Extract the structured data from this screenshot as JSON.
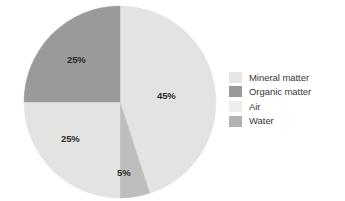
{
  "chart_data": {
    "type": "pie",
    "title": "",
    "subtitle": "",
    "xlabel": "",
    "ylabel": "",
    "grid": false,
    "legend_position": "right",
    "units": "percent",
    "start_angle_deg": 0,
    "direction": "clockwise",
    "categories": [
      "Mineral matter",
      "Organic matter",
      "Air",
      "Water"
    ],
    "values": [
      45,
      25,
      5,
      25
    ],
    "labels": [
      "45%",
      "25%",
      "5%",
      "25%"
    ],
    "colors": [
      "#e3e3e3",
      "#9a9a9a",
      "#bdbdbd",
      "#c9c9c9"
    ],
    "slices": [
      {
        "name": "Mineral matter",
        "value": 45,
        "label": "45%",
        "color": "#e3e3e3",
        "start_deg": 0,
        "end_deg": 162
      },
      {
        "name": "Air",
        "value": 5,
        "label": "5%",
        "color": "#bdbdbd",
        "start_deg": 162,
        "end_deg": 180
      },
      {
        "name": "Water",
        "value": 25,
        "label": "25%",
        "color": "#e3e3e3",
        "start_deg": 180,
        "end_deg": 270
      },
      {
        "name": "Organic matter",
        "value": 25,
        "label": "25%",
        "color": "#9a9a9a",
        "start_deg": 270,
        "end_deg": 360
      }
    ]
  },
  "pie": {
    "center_x": 120,
    "center_y": 102,
    "radius": 96,
    "labels": {
      "mineral": "45%",
      "organic": "25%",
      "water": "25%",
      "air": "5%"
    }
  },
  "legend": {
    "items": [
      {
        "label": "Mineral matter",
        "color": "#e6e6e6",
        "swatch_name": "legend-swatch-mineral-matter"
      },
      {
        "label": "Organic matter",
        "color": "#9a9a9a",
        "swatch_name": "legend-swatch-organic-matter"
      },
      {
        "label": "Air",
        "color": "#eeeeee",
        "swatch_name": "legend-swatch-air"
      },
      {
        "label": "Water",
        "color": "#b2b2b2",
        "swatch_name": "legend-swatch-water"
      }
    ]
  },
  "palette": {
    "background": "#ffffff",
    "label_text": "#2b2b2b",
    "legend_text": "#373737",
    "slice_mineral": "#e3e3e3",
    "slice_organic": "#9a9a9a",
    "slice_air": "#bdbdbd",
    "slice_water": "#e3e3e3"
  }
}
